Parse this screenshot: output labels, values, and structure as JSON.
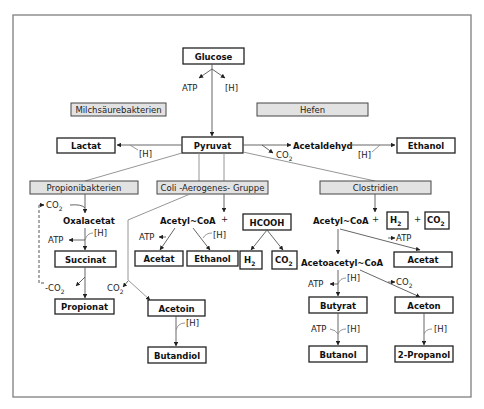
{
  "groups": {
    "milchsaeure": "Milchsäurebakterien",
    "hefen": "Hefen",
    "propioni": "Propionibakterien",
    "coli": "Coli -Aerogenes- Gruppe",
    "clostridien": "Clostridien"
  },
  "products": {
    "glucose": "Glucose",
    "pyruvat": "Pyruvat",
    "lactat": "Lactat",
    "ethanol_hefe": "Ethanol",
    "propionat": "Propionat",
    "succinat": "Succinat",
    "acetat_coli": "Acetat",
    "ethanol_coli": "Ethanol",
    "hcooh": "HCOOH",
    "h2_coli": "H",
    "co2_coli": "CO",
    "acetoin": "Acetoin",
    "butandiol": "Butandiol",
    "h2_clos": "H",
    "co2_clos": "CO",
    "acetat_clos": "Acetat",
    "butyrat": "Butyrat",
    "aceton": "Aceton",
    "butanol": "Butanol",
    "propanol": "2-Propanol"
  },
  "intermediates": {
    "acetaldehyd": "Acetaldehyd",
    "oxalacetat": "Oxalacetat",
    "acetylcoa_coli": "Acetyl~CoA",
    "acetylcoa_clos": "Acetyl~CoA",
    "acetoacetylcoa": "Acetoacetyl~CoA"
  },
  "labels": {
    "atp": "ATP",
    "h": "[H]",
    "co2": "CO",
    "minus_co2": "-CO",
    "sub2": "2",
    "plus": "+"
  }
}
